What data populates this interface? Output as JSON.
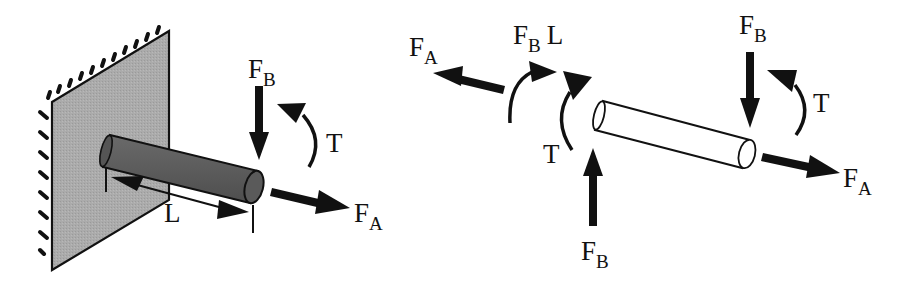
{
  "figure": {
    "colors": {
      "wall_fill": "#a8a8a8",
      "shaft_fill": "#5a5a5a",
      "ink": "#111111",
      "background": "#ffffff"
    }
  },
  "left_panel": {
    "name": "fixed-cantilever-shaft",
    "labels": {
      "force_b": {
        "main": "F",
        "sub": "B"
      },
      "torque": "T",
      "force_a": {
        "main": "F",
        "sub": "A"
      },
      "length": "L"
    }
  },
  "right_panel": {
    "name": "free-body-diagram",
    "labels": {
      "left_force_a": {
        "main": "F",
        "sub": "A"
      },
      "moment_fb_l": {
        "main": "F",
        "sub": "B",
        "suffix": "L"
      },
      "left_torque": "T",
      "left_force_b": {
        "main": "F",
        "sub": "B"
      },
      "right_force_b": {
        "main": "F",
        "sub": "B"
      },
      "right_torque": "T",
      "right_force_a": {
        "main": "F",
        "sub": "A"
      }
    }
  }
}
